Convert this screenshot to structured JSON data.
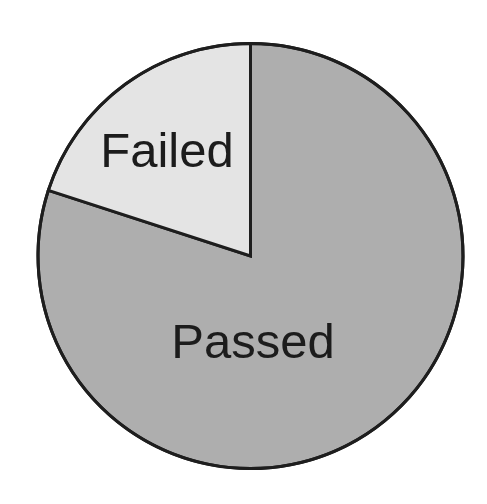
{
  "chart_data": {
    "type": "pie",
    "title": "",
    "categories": [
      "Failed",
      "Passed"
    ],
    "values": [
      20,
      80
    ],
    "unit": "%",
    "start_angle_deg": 0,
    "direction": "counterclockwise-from-top for Failed slice",
    "colors": {
      "Failed": "#e4e4e4",
      "Passed": "#aeaeae",
      "outline": "#1e1e1e"
    },
    "labels_inside_slices": true,
    "legend": null
  },
  "labels": {
    "failed": "Failed",
    "passed": "Passed"
  }
}
